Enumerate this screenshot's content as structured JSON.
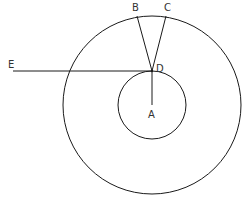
{
  "diagram": {
    "type": "geometry",
    "stroke_color": "#1a1a1a",
    "label_color": "#333333",
    "circles": [
      {
        "name": "outer-circle",
        "cx": 152,
        "cy": 105,
        "r": 89
      },
      {
        "name": "inner-circle",
        "cx": 152,
        "cy": 105,
        "r": 34
      }
    ],
    "points": {
      "A": {
        "label": "A",
        "x": 152,
        "y": 105
      },
      "B": {
        "label": "B",
        "x": 137,
        "y": 16
      },
      "C": {
        "label": "C",
        "x": 166,
        "y": 16
      },
      "D": {
        "label": "D",
        "x": 152,
        "y": 71
      },
      "E": {
        "label": "E",
        "x": 13,
        "y": 71
      }
    },
    "segments": [
      {
        "name": "segment-DB",
        "from": "D",
        "to": "B"
      },
      {
        "name": "segment-DC",
        "from": "D",
        "to": "C"
      },
      {
        "name": "segment-DE",
        "from": "D",
        "to": "E"
      },
      {
        "name": "segment-DA",
        "from": "D",
        "to": "A"
      }
    ],
    "labels": {
      "A": "A",
      "B": "B",
      "C": "C",
      "D": "D",
      "E": "E"
    }
  }
}
